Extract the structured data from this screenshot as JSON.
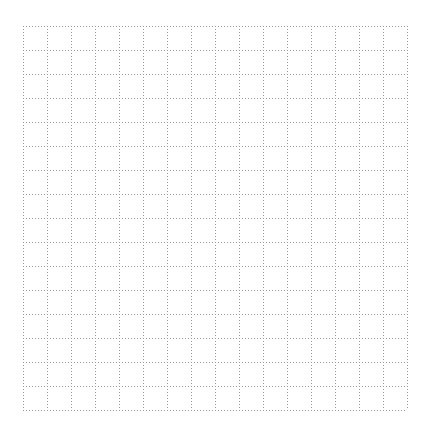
{
  "grid": {
    "columns": 16,
    "rows": 16,
    "cell_size": 24,
    "line_color": "#9a9a9a",
    "line_style": "dotted",
    "background": "#ffffff"
  }
}
